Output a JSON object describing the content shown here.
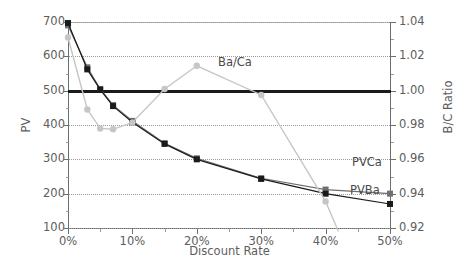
{
  "chart_data": {
    "type": "line",
    "title": "",
    "xlabel": "Discount Rate",
    "ylabel": "PV",
    "ylabel_secondary": "B/C Ratio",
    "xlim": [
      0,
      50
    ],
    "ylim": [
      100,
      700
    ],
    "ylim_secondary": [
      0.92,
      1.04
    ],
    "grid": true,
    "legend": "inline-annotations",
    "x_ticks": [
      "0%",
      "10%",
      "20%",
      "30%",
      "40%",
      "50%"
    ],
    "x_tick_values": [
      0,
      10,
      20,
      30,
      40,
      50
    ],
    "y_ticks_left": [
      "100",
      "200",
      "300",
      "400",
      "500",
      "600",
      "700"
    ],
    "y_tick_values_left": [
      100,
      200,
      300,
      400,
      500,
      600,
      700
    ],
    "y_ticks_right": [
      "0.92",
      "0.94",
      "0.96",
      "0.98",
      "1.00",
      "1.02",
      "1.04"
    ],
    "y_tick_values_right": [
      0.92,
      0.94,
      0.96,
      0.98,
      1.0,
      1.02,
      1.04
    ],
    "reference_line": {
      "label": "break-even",
      "pv_value": 500,
      "bc_value": 1.0,
      "color": "#1a1a1a"
    },
    "series": [
      {
        "name": "PVCa",
        "axis": "left",
        "color": "#6f6f6f",
        "marker": "square",
        "x": [
          0,
          3,
          5,
          7,
          10,
          15,
          20,
          30,
          40,
          50
        ],
        "values": [
          690,
          568,
          505,
          458,
          412,
          347,
          303,
          245,
          212,
          200
        ]
      },
      {
        "name": "PVBa",
        "axis": "left",
        "color": "#1a1a1a",
        "marker": "square",
        "x": [
          0,
          3,
          5,
          7,
          10,
          15,
          20,
          30,
          40,
          50
        ],
        "values": [
          697,
          562,
          503,
          455,
          408,
          345,
          300,
          243,
          200,
          170
        ]
      },
      {
        "name": "Ba/Ca",
        "axis": "right",
        "color": "#c6c6c6",
        "marker": "circle",
        "x": [
          0,
          3,
          5,
          7,
          10,
          15,
          20,
          30,
          40,
          42
        ],
        "values": [
          1.031,
          0.989,
          0.978,
          0.9775,
          0.9815,
          1.001,
          1.0145,
          0.9975,
          0.9355,
          0.918
        ]
      }
    ],
    "annotations": [
      {
        "text": "Ba/Ca",
        "series": "Ba/Ca"
      },
      {
        "text": "PVCa",
        "series": "PVCa"
      },
      {
        "text": "PVBa",
        "series": "PVBa"
      }
    ]
  }
}
